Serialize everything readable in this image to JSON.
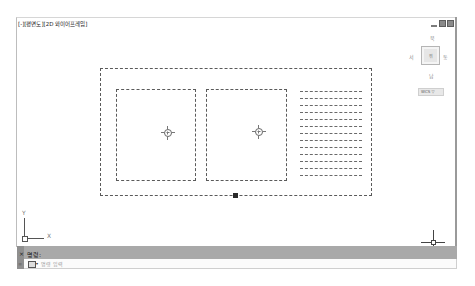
{
  "viewport": {
    "label": "[-][평면도][2D 와이어프레임]",
    "window_controls": [
      "minimize",
      "restore",
      "close"
    ]
  },
  "viewcube": {
    "north": "북",
    "west": "서",
    "east": "동",
    "south": "남",
    "face": "위",
    "ucs_menu": "WCS ▽"
  },
  "drawing": {
    "outer_frame": "dashed rectangle",
    "inner_boxes": 2,
    "hatch_lines": 13,
    "center_markers": 2,
    "grip_count": 1
  },
  "ucs_icon": {
    "x_label": "X",
    "y_label": "Y"
  },
  "command_line": {
    "close_label": "×",
    "prompt": "명령:",
    "input_placeholder": "명령 입력",
    "dropdown_arrow": "▾",
    "history_icon": "≡"
  }
}
